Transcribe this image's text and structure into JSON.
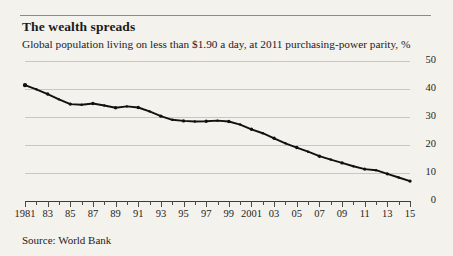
{
  "header": {
    "title": "The wealth spreads",
    "subtitle": "Global population living on less than $1.90 a day, at 2011 purchasing-power parity, %"
  },
  "footer": {
    "source": "Source: World Bank"
  },
  "chart_data": {
    "type": "line",
    "title": "The wealth spreads",
    "subtitle": "Global population living on less than $1.90 a day, at 2011 purchasing-power parity, %",
    "xlabel": "",
    "ylabel": "",
    "ylim": [
      0,
      50
    ],
    "yticks": [
      0,
      10,
      20,
      30,
      40,
      50
    ],
    "ytick_labels": [
      "0",
      "10",
      "20",
      "30",
      "40",
      "50"
    ],
    "y_axis_position": "right",
    "grid": true,
    "grid_axis": "y",
    "legend": false,
    "xlim": [
      1981,
      2015
    ],
    "x": [
      1981,
      1982,
      1983,
      1984,
      1985,
      1986,
      1987,
      1988,
      1989,
      1990,
      1991,
      1992,
      1993,
      1994,
      1995,
      1996,
      1997,
      1998,
      1999,
      2000,
      2001,
      2002,
      2003,
      2004,
      2005,
      2006,
      2007,
      2008,
      2009,
      2010,
      2011,
      2012,
      2013,
      2014,
      2015
    ],
    "xtick_labels": [
      "1981",
      "",
      "83",
      "",
      "85",
      "",
      "87",
      "",
      "89",
      "",
      "91",
      "",
      "93",
      "",
      "95",
      "",
      "97",
      "",
      "99",
      "",
      "2001",
      "",
      "03",
      "",
      "05",
      "",
      "07",
      "",
      "09",
      "",
      "11",
      "",
      "13",
      "",
      "15"
    ],
    "series": [
      {
        "name": "Share of global population living on less than $1.90 a day",
        "color": "#111111",
        "values": [
          41.4,
          39.9,
          38.2,
          36.3,
          34.6,
          34.4,
          34.8,
          34.1,
          33.3,
          33.8,
          33.4,
          32.0,
          30.3,
          29.0,
          28.6,
          28.4,
          28.5,
          28.7,
          28.4,
          27.3,
          25.6,
          24.2,
          22.4,
          20.6,
          19.1,
          17.6,
          16.0,
          14.8,
          13.6,
          12.4,
          11.4,
          11.0,
          9.7,
          8.4,
          7.1
        ]
      }
    ],
    "annotations": []
  },
  "colors": {
    "background": "#f4f2ed",
    "line": "#111111",
    "gridline": "#c9c7c2",
    "axis": "#3a3a3a",
    "rule": "#8d8a84",
    "text": "#1d1d1d"
  }
}
